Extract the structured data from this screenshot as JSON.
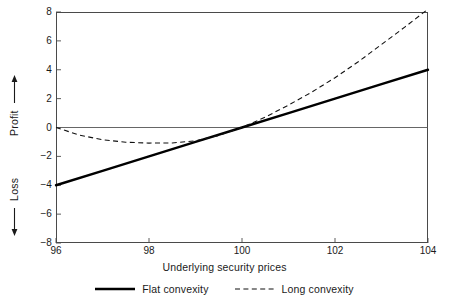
{
  "chart_data": {
    "type": "line",
    "title": "",
    "xlabel": "Underlying security prices",
    "ylabel_positive": "Profit",
    "ylabel_negative": "Loss",
    "xlim": [
      96,
      104
    ],
    "ylim": [
      -8,
      8
    ],
    "xticks": [
      96,
      98,
      100,
      102,
      104
    ],
    "yticks": [
      8,
      6,
      4,
      2,
      0,
      -2,
      -4,
      -6,
      -8
    ],
    "xtick_labels": [
      "96",
      "98",
      "100",
      "102",
      "104"
    ],
    "ytick_labels": [
      "8",
      "6",
      "4",
      "2",
      "0",
      "−2",
      "−4",
      "−6",
      "−8"
    ],
    "grid": false,
    "zero_line": true,
    "legend_position": "bottom",
    "series": [
      {
        "name": "Flat convexity",
        "style": "solid",
        "width": 2.4,
        "color": "#000000",
        "x": [
          96,
          97,
          98,
          99,
          100,
          101,
          102,
          103,
          104
        ],
        "values": [
          -4.0,
          -3.0,
          -2.0,
          -1.0,
          0.0,
          1.0,
          2.0,
          3.0,
          4.0
        ]
      },
      {
        "name": "Long convexity",
        "style": "dashed",
        "width": 1.1,
        "color": "#111111",
        "x": [
          96,
          96.5,
          97,
          97.5,
          98,
          98.5,
          99,
          99.5,
          100,
          100.5,
          101,
          101.5,
          102,
          102.5,
          103,
          103.5,
          104
        ],
        "values": [
          0.0,
          -0.52,
          -0.85,
          -1.02,
          -1.08,
          -1.07,
          -0.92,
          -0.55,
          0.0,
          0.72,
          1.55,
          2.45,
          3.45,
          4.55,
          5.75,
          6.95,
          8.2
        ]
      }
    ],
    "annotations": {
      "profit_arrow": "↑",
      "loss_arrow": "↓"
    }
  },
  "axis": {
    "y_title_profit": "Profit",
    "y_title_loss": "Loss",
    "x_title": "Underlying security prices"
  },
  "legend": {
    "items": [
      {
        "label": "Flat convexity",
        "style": "solid"
      },
      {
        "label": "Long convexity",
        "style": "dashed"
      }
    ]
  },
  "colors": {
    "frame": "#4a4a4a",
    "flat": "#000000",
    "long": "#111111",
    "zero_line": "#555555",
    "background": "#ffffff"
  }
}
